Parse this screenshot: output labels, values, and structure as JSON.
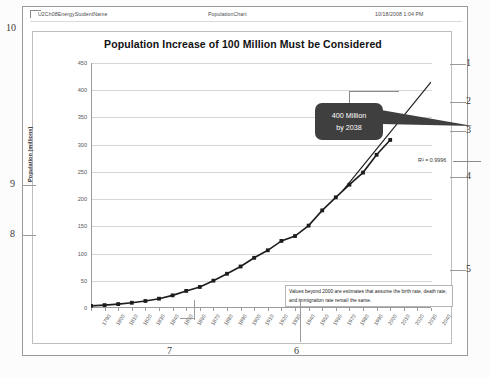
{
  "document": {
    "header": {
      "left": "U2Ch08EnergyStudentName",
      "center": "PopulationChart",
      "right": "10/18/2008 1:04 PM"
    }
  },
  "chart": {
    "title": "Population Increase of 100 Million Must be Considered",
    "y_axis_title": "Population (millions)",
    "y_ticks": [
      "450",
      "400",
      "350",
      "300",
      "250",
      "200",
      "150",
      "100",
      "50",
      "0"
    ],
    "callout": {
      "line1": "400 Million",
      "line2": "by 2038",
      "bg_color": "#3f3f3f",
      "text_color": "#ffffff"
    },
    "trendline_label": "R² = 0.9996",
    "note": "Values beyond 2000 are estimates that assume the birth rate, death rate, and immigration rate remaiI the same.",
    "series_color": "#1d1d1d",
    "gridline_color": "#d6d6d6"
  },
  "chart_data": {
    "type": "line",
    "title": "Population Increase of 100 Million Must be Considered",
    "xlabel": "",
    "ylabel": "Population (millions)",
    "ylim": [
      0,
      450
    ],
    "xlim": [
      1790,
      2040
    ],
    "grid": true,
    "legend": "none",
    "x": [
      1790,
      1800,
      1810,
      1820,
      1830,
      1840,
      1850,
      1860,
      1870,
      1880,
      1890,
      1900,
      1910,
      1920,
      1930,
      1940,
      1950,
      1960,
      1970,
      1980,
      1990,
      2000,
      2010
    ],
    "x_tick_labels": [
      "1790",
      "1800",
      "1810",
      "1820",
      "1830",
      "1840",
      "1850",
      "1860",
      "1870",
      "1880",
      "1890",
      "1900",
      "1910",
      "1920",
      "1930",
      "1940",
      "1950",
      "1960",
      "1970",
      "1980",
      "1990",
      "2000",
      "2010",
      "2020",
      "2030",
      "2040"
    ],
    "values": [
      3.9,
      5.3,
      7.2,
      9.6,
      12.9,
      17.1,
      23.2,
      31.4,
      38.6,
      50.2,
      62.9,
      76.2,
      92.2,
      106.0,
      123.2,
      132.2,
      151.3,
      179.3,
      203.3,
      226.5,
      248.7,
      281.4,
      308.7
    ],
    "annotations": [
      {
        "text": "400 Million by 2038",
        "x": 2038,
        "y": 400
      },
      {
        "text": "R² = 0.9996",
        "x": 2012,
        "y": 265
      },
      {
        "text": "Values beyond 2000 are estimates that assume the birth rate, death rate, and immigration rate remaiI the same.",
        "x": 1950,
        "y": 60
      }
    ],
    "trendline": {
      "present": true,
      "r_squared": 0.9996,
      "extends_to": 2040,
      "end_value": 415
    }
  },
  "annotations": {
    "numbers": [
      {
        "id": "1",
        "side": "right"
      },
      {
        "id": "2",
        "side": "right"
      },
      {
        "id": "3",
        "side": "right"
      },
      {
        "id": "4",
        "side": "right"
      },
      {
        "id": "5",
        "side": "right"
      },
      {
        "id": "6",
        "side": "bottom"
      },
      {
        "id": "7",
        "side": "bottom"
      },
      {
        "id": "8",
        "side": "left"
      },
      {
        "id": "9",
        "side": "left"
      },
      {
        "id": "10",
        "side": "left"
      }
    ]
  }
}
